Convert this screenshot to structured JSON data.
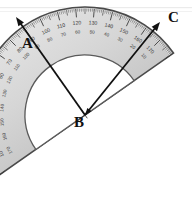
{
  "figure": {
    "background_color": "#ffffff",
    "scan_artifact_color": "#e6e6e6"
  },
  "protractor": {
    "name": "semicircular-protractor",
    "body_color": "#d7d7d7",
    "body_edge_color": "#4a4a4a",
    "inner_cutout_color": "#ffffff",
    "tick_color": "#3a3a3a",
    "center_x": 85,
    "center_y": 115,
    "outer_radius": 108,
    "inner_radius": 60,
    "rotation_degrees": -35,
    "outer_scale_labels": [
      "10",
      "20",
      "30",
      "40",
      "50",
      "60",
      "70",
      "80",
      "90",
      "100",
      "110",
      "120",
      "130",
      "140",
      "150",
      "160",
      "170"
    ],
    "inner_scale_labels": [
      "170",
      "160",
      "150",
      "140",
      "130",
      "120",
      "110",
      "100",
      "90",
      "80",
      "70",
      "60",
      "50",
      "40",
      "30",
      "20",
      "10"
    ]
  },
  "rays": [
    {
      "name": "ray-ba",
      "from_x": 85,
      "from_y": 115,
      "to_x": 16,
      "to_y": 17,
      "color": "#111111",
      "endpoint_label": "A",
      "label_x": 22,
      "label_y": 48
    },
    {
      "name": "ray-bc",
      "from_x": 85,
      "from_y": 115,
      "to_x": 160,
      "to_y": 22,
      "color": "#111111",
      "endpoint_label": "C",
      "label_x": 168,
      "label_y": 22
    }
  ],
  "vertex": {
    "name": "vertex-b",
    "label": "B",
    "x": 85,
    "y": 115,
    "label_x": 74,
    "label_y": 127
  },
  "labels": {
    "a": "A",
    "b": "B",
    "c": "C"
  }
}
